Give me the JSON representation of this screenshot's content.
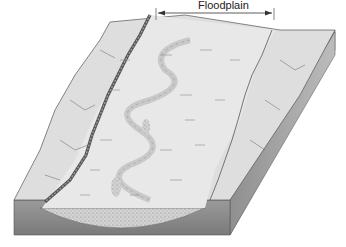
{
  "diagram": {
    "type": "block-diagram",
    "labels": {
      "floodplain": "Floodplain"
    },
    "colors": {
      "top_surface": "#d9d9d9",
      "floodplain_surface": "#e4e4e4",
      "side_face_dark": "#8a8a8a",
      "side_face_light": "#b5b5b5",
      "sediment_fill": "#cfcfcf",
      "river_channel": "#666666",
      "outline": "#555555"
    }
  }
}
